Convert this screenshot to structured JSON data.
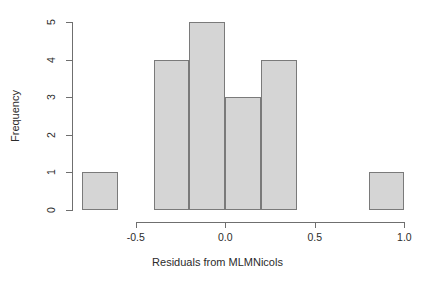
{
  "chart_data": {
    "type": "bar",
    "title": "",
    "subtitle": "",
    "xlabel": "Residuals from MLMNicols",
    "ylabel": "Frequency",
    "xlim": [
      -0.85,
      1.02
    ],
    "ylim": [
      0,
      5
    ],
    "grid": false,
    "legend": false,
    "bin_width": 0.2,
    "bins": [
      {
        "label": "-0.8 to -0.6",
        "x0": -0.8,
        "x1": -0.6,
        "value": 1
      },
      {
        "label": "-0.4 to -0.2",
        "x0": -0.4,
        "x1": -0.2,
        "value": 4
      },
      {
        "label": "-0.2 to 0.0",
        "x0": -0.2,
        "x1": 0.0,
        "value": 5
      },
      {
        "label": "0.0 to 0.2",
        "x0": 0.0,
        "x1": 0.2,
        "value": 3
      },
      {
        "label": "0.2 to 0.4",
        "x0": 0.2,
        "x1": 0.4,
        "value": 4
      },
      {
        "label": "0.8 to 1.0",
        "x0": 0.8,
        "x1": 1.0,
        "value": 1
      }
    ],
    "categories": [
      "-0.8 to -0.6",
      "-0.4 to -0.2",
      "-0.2 to 0.0",
      "0.0 to 0.2",
      "0.2 to 0.4",
      "0.8 to 1.0"
    ],
    "values": [
      1,
      4,
      5,
      3,
      4,
      1
    ],
    "x_ticks": [
      {
        "value": -0.5,
        "label": "-0.5"
      },
      {
        "value": 0.0,
        "label": "0.0"
      },
      {
        "value": 0.5,
        "label": "0.5"
      },
      {
        "value": 1.0,
        "label": "1.0"
      }
    ],
    "y_ticks": [
      {
        "value": 0,
        "label": "0"
      },
      {
        "value": 1,
        "label": "1"
      },
      {
        "value": 2,
        "label": "2"
      },
      {
        "value": 3,
        "label": "3"
      },
      {
        "value": 4,
        "label": "4"
      },
      {
        "value": 5,
        "label": "5"
      }
    ],
    "colors": {
      "bar_fill": "#d5d5d5",
      "bar_border": "#7a7a7a",
      "axis": "#6f6f6f",
      "text": "#2b2b2b",
      "background": "#ffffff"
    }
  }
}
